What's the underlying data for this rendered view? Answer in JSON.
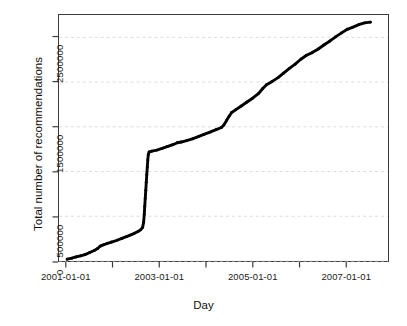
{
  "chart_data": {
    "type": "line",
    "title": "",
    "xlabel": "Day",
    "ylabel": "Total number of recommendations",
    "grid": "horizontal-dashed",
    "legend": "none",
    "x_type": "date",
    "xlim": [
      "2000-11-01",
      "2007-12-01"
    ],
    "ylim": [
      0,
      2750000
    ],
    "x_ticks": [
      {
        "value": "2001-01-01",
        "label": "2001-01-01",
        "labeled": true
      },
      {
        "value": "2002-01-01",
        "label": "",
        "labeled": false
      },
      {
        "value": "2003-01-01",
        "label": "2003-01-01",
        "labeled": true
      },
      {
        "value": "2004-01-01",
        "label": "",
        "labeled": false
      },
      {
        "value": "2005-01-01",
        "label": "2005-01-01",
        "labeled": true
      },
      {
        "value": "2006-01-01",
        "label": "",
        "labeled": false
      },
      {
        "value": "2007-01-01",
        "label": "2007-01-01",
        "labeled": true
      }
    ],
    "y_ticks": [
      {
        "value": 0,
        "label": "0",
        "labeled": true
      },
      {
        "value": 500000,
        "label": "500000",
        "labeled": true
      },
      {
        "value": 1000000,
        "label": "",
        "labeled": false
      },
      {
        "value": 1500000,
        "label": "1500000",
        "labeled": true
      },
      {
        "value": 2000000,
        "label": "",
        "labeled": false
      },
      {
        "value": 2500000,
        "label": "2500000",
        "labeled": true
      }
    ],
    "series": [
      {
        "name": "Total number of recommendations",
        "color": "#000000",
        "style": "thick-dotted-line",
        "points": [
          {
            "x": "2001-01-05",
            "y": 20000
          },
          {
            "x": "2001-02-10",
            "y": 32000
          },
          {
            "x": "2001-03-15",
            "y": 45000
          },
          {
            "x": "2001-04-20",
            "y": 58000
          },
          {
            "x": "2001-05-25",
            "y": 72000
          },
          {
            "x": "2001-07-01",
            "y": 95000
          },
          {
            "x": "2001-08-05",
            "y": 118000
          },
          {
            "x": "2001-09-01",
            "y": 140000
          },
          {
            "x": "2001-09-20",
            "y": 165000
          },
          {
            "x": "2001-10-05",
            "y": 175000
          },
          {
            "x": "2001-10-20",
            "y": 182000
          },
          {
            "x": "2001-11-15",
            "y": 196000
          },
          {
            "x": "2001-12-20",
            "y": 212000
          },
          {
            "x": "2002-02-01",
            "y": 232000
          },
          {
            "x": "2002-03-10",
            "y": 252000
          },
          {
            "x": "2002-04-15",
            "y": 272000
          },
          {
            "x": "2002-05-20",
            "y": 292000
          },
          {
            "x": "2002-06-20",
            "y": 312000
          },
          {
            "x": "2002-07-15",
            "y": 330000
          },
          {
            "x": "2002-08-05",
            "y": 348000
          },
          {
            "x": "2002-08-20",
            "y": 375000
          },
          {
            "x": "2002-08-28",
            "y": 430000
          },
          {
            "x": "2002-09-02",
            "y": 520000
          },
          {
            "x": "2002-09-06",
            "y": 610000
          },
          {
            "x": "2002-09-10",
            "y": 700000
          },
          {
            "x": "2002-09-14",
            "y": 790000
          },
          {
            "x": "2002-09-18",
            "y": 880000
          },
          {
            "x": "2002-09-22",
            "y": 965000
          },
          {
            "x": "2002-09-26",
            "y": 1050000
          },
          {
            "x": "2002-09-30",
            "y": 1130000
          },
          {
            "x": "2002-10-04",
            "y": 1190000
          },
          {
            "x": "2002-10-10",
            "y": 1218000
          },
          {
            "x": "2002-11-01",
            "y": 1228000
          },
          {
            "x": "2002-12-10",
            "y": 1240000
          },
          {
            "x": "2003-01-20",
            "y": 1258000
          },
          {
            "x": "2003-03-01",
            "y": 1278000
          },
          {
            "x": "2003-04-15",
            "y": 1300000
          },
          {
            "x": "2003-05-20",
            "y": 1322000
          },
          {
            "x": "2003-06-20",
            "y": 1330000
          },
          {
            "x": "2003-08-01",
            "y": 1345000
          },
          {
            "x": "2003-09-15",
            "y": 1365000
          },
          {
            "x": "2003-11-01",
            "y": 1390000
          },
          {
            "x": "2003-12-15",
            "y": 1415000
          },
          {
            "x": "2004-02-01",
            "y": 1440000
          },
          {
            "x": "2004-03-20",
            "y": 1468000
          },
          {
            "x": "2004-05-01",
            "y": 1492000
          },
          {
            "x": "2004-05-20",
            "y": 1520000
          },
          {
            "x": "2004-06-10",
            "y": 1570000
          },
          {
            "x": "2004-07-01",
            "y": 1620000
          },
          {
            "x": "2004-07-20",
            "y": 1660000
          },
          {
            "x": "2004-08-20",
            "y": 1690000
          },
          {
            "x": "2004-10-01",
            "y": 1730000
          },
          {
            "x": "2004-11-15",
            "y": 1775000
          },
          {
            "x": "2005-01-01",
            "y": 1820000
          },
          {
            "x": "2005-02-15",
            "y": 1870000
          },
          {
            "x": "2005-03-20",
            "y": 1925000
          },
          {
            "x": "2005-04-20",
            "y": 1970000
          },
          {
            "x": "2005-06-01",
            "y": 2005000
          },
          {
            "x": "2005-07-20",
            "y": 2050000
          },
          {
            "x": "2005-09-01",
            "y": 2100000
          },
          {
            "x": "2005-10-15",
            "y": 2150000
          },
          {
            "x": "2005-12-01",
            "y": 2200000
          },
          {
            "x": "2006-01-15",
            "y": 2255000
          },
          {
            "x": "2006-03-01",
            "y": 2300000
          },
          {
            "x": "2006-04-15",
            "y": 2330000
          },
          {
            "x": "2006-06-01",
            "y": 2370000
          },
          {
            "x": "2006-07-15",
            "y": 2415000
          },
          {
            "x": "2006-09-01",
            "y": 2460000
          },
          {
            "x": "2006-10-15",
            "y": 2505000
          },
          {
            "x": "2006-12-01",
            "y": 2550000
          },
          {
            "x": "2007-01-15",
            "y": 2590000
          },
          {
            "x": "2007-03-01",
            "y": 2615000
          },
          {
            "x": "2007-04-20",
            "y": 2645000
          },
          {
            "x": "2007-06-01",
            "y": 2662000
          },
          {
            "x": "2007-07-15",
            "y": 2670000
          }
        ]
      }
    ]
  },
  "style": {
    "axis_color": "#3b3b3b",
    "grid_color": "#d9d9d9",
    "line_color": "#000000",
    "text_color": "#1a1a1a",
    "background": "#ffffff"
  }
}
